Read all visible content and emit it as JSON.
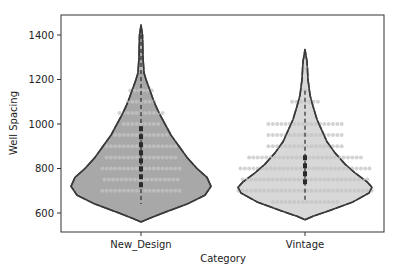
{
  "chart_data": {
    "type": "violin",
    "title": "",
    "xlabel": "Category",
    "ylabel": "Well Spacing",
    "categories": [
      "New_Design",
      "Vintage"
    ],
    "ylim": [
      520,
      1490
    ],
    "yticks": [
      600,
      800,
      1000,
      1200,
      1400
    ],
    "grid": false,
    "legend": null,
    "overlay": "swarm",
    "series": [
      {
        "name": "New_Design",
        "fill": "#a8a8a8",
        "violin_range": [
          560,
          1445
        ],
        "box": {
          "q1": 710,
          "median": 820,
          "q3": 990,
          "whisker_low": 640,
          "whisker_high": 1400
        },
        "swarm_rows": [
          {
            "value": 700,
            "count": 19
          },
          {
            "value": 750,
            "count": 18
          },
          {
            "value": 800,
            "count": 19
          },
          {
            "value": 850,
            "count": 17
          },
          {
            "value": 900,
            "count": 17
          },
          {
            "value": 950,
            "count": 13
          },
          {
            "value": 1000,
            "count": 9
          },
          {
            "value": 1050,
            "count": 11
          },
          {
            "value": 1100,
            "count": 7
          },
          {
            "value": 1150,
            "count": 6
          },
          {
            "value": 1250,
            "count": 1
          },
          {
            "value": 1350,
            "count": 1
          }
        ]
      },
      {
        "name": "Vintage",
        "fill": "#d8d8d8",
        "violin_range": [
          570,
          1335
        ],
        "box": {
          "q1": 725,
          "median": 790,
          "q3": 860,
          "whisker_low": 650,
          "whisker_high": 1150
        },
        "swarm_rows": [
          {
            "value": 650,
            "count": 16
          },
          {
            "value": 700,
            "count": 32
          },
          {
            "value": 750,
            "count": 30
          },
          {
            "value": 800,
            "count": 31
          },
          {
            "value": 850,
            "count": 27
          },
          {
            "value": 900,
            "count": 18
          },
          {
            "value": 950,
            "count": 18
          },
          {
            "value": 1000,
            "count": 18
          },
          {
            "value": 1100,
            "count": 7
          },
          {
            "value": 1150,
            "count": 1
          },
          {
            "value": 1250,
            "count": 2
          }
        ]
      }
    ]
  },
  "axes": {
    "x_label": "Category",
    "y_label": "Well Spacing",
    "x_tick_labels": [
      "New_Design",
      "Vintage"
    ],
    "y_tick_labels": [
      "600",
      "800",
      "1000",
      "1200",
      "1400"
    ]
  },
  "colors": {
    "frame": "#333333",
    "violin_edge": "#3a3a3a",
    "swarm_point": "#c4c4c4",
    "box": "#2a2a2a"
  }
}
